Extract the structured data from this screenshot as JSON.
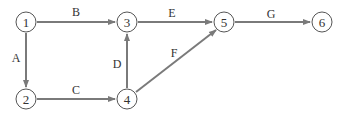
{
  "diagram": {
    "type": "network",
    "nodes": [
      {
        "id": "1",
        "label": "1"
      },
      {
        "id": "2",
        "label": "2"
      },
      {
        "id": "3",
        "label": "3"
      },
      {
        "id": "4",
        "label": "4"
      },
      {
        "id": "5",
        "label": "5"
      },
      {
        "id": "6",
        "label": "6"
      }
    ],
    "edges": [
      {
        "from": "1",
        "to": "3",
        "label": "B"
      },
      {
        "from": "1",
        "to": "2",
        "label": "A"
      },
      {
        "from": "2",
        "to": "4",
        "label": "C"
      },
      {
        "from": "4",
        "to": "3",
        "label": "D"
      },
      {
        "from": "3",
        "to": "5",
        "label": "E"
      },
      {
        "from": "4",
        "to": "5",
        "label": "F"
      },
      {
        "from": "5",
        "to": "6",
        "label": "G"
      }
    ],
    "colors": {
      "edge": "#7a7a7a",
      "node_stroke": "#555555",
      "text": "#333333"
    }
  }
}
